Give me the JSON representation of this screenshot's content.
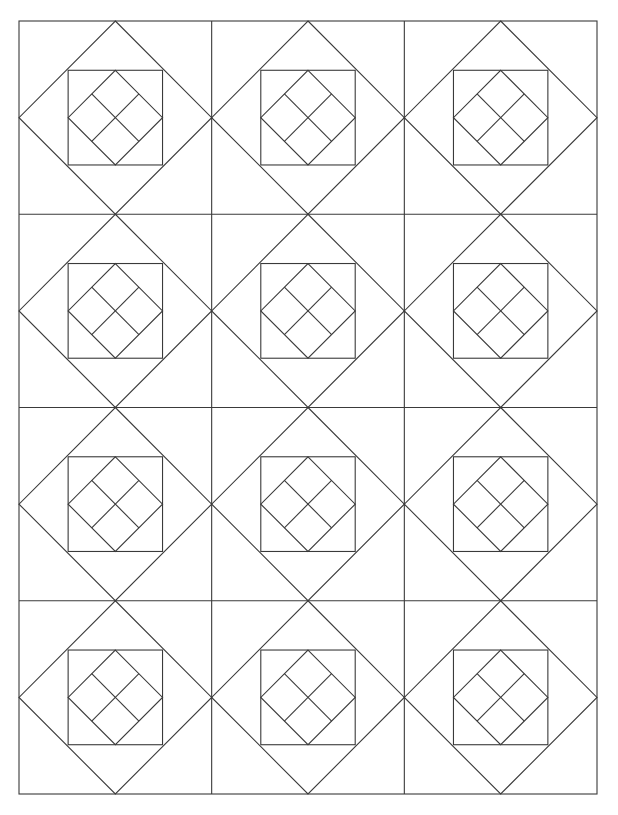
{
  "pattern": {
    "name": "quilt-block-pattern",
    "columns": 3,
    "rows": 4,
    "frame": {
      "x": 19,
      "y": 21,
      "width": 578,
      "height": 773
    },
    "line_color": "#3a3a3a",
    "background": "#ffffff",
    "stroke_width": 1.1,
    "block_layers": [
      "outer-diamond",
      "inner-square",
      "center-diamond",
      "center-diamond-cross"
    ],
    "inner_square_inset": 0.255
  }
}
